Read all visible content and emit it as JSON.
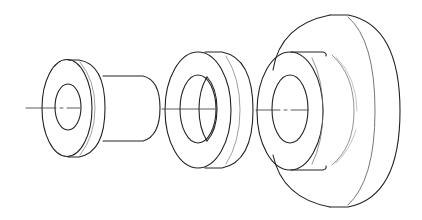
{
  "figure": {
    "title": "Exploded view of bushing assembly",
    "parts": [
      {
        "name": "flanged-bushing",
        "label": "Flanged bushing"
      },
      {
        "name": "washer",
        "label": "Washer"
      },
      {
        "name": "flanged-collar",
        "label": "Flanged collar"
      }
    ],
    "colors": {
      "stroke": "#222222",
      "light_stroke": "#777777",
      "background": "#ffffff"
    }
  }
}
